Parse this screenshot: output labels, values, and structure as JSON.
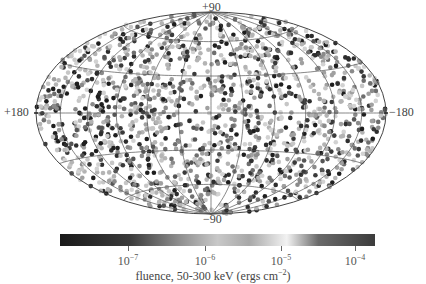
{
  "chart_data": {
    "type": "scatter",
    "projection": "aitoff/hammer all-sky (ellipse)",
    "title": "",
    "coordinate_labels": {
      "top": "+90",
      "bottom": "-90",
      "left": "+180",
      "right": "-180"
    },
    "grid": {
      "on": true,
      "meridians_deg": [
        -150,
        -120,
        -90,
        -60,
        -30,
        0,
        30,
        60,
        90,
        120,
        150
      ],
      "parallels_deg": [
        -60,
        -30,
        0,
        30,
        60
      ]
    },
    "points": {
      "description": "Isotropically distributed gamma-ray bursts across the sky, grayscale-coded by fluence",
      "approx_count": 1600,
      "distribution": "uniform over sphere"
    },
    "colorbar": {
      "label": "fluence, 50-300 keV (ergs cm^-2)",
      "scale": "log",
      "range": [
        1.5e-08,
        0.0003
      ],
      "ticks": [
        1e-07,
        1e-06,
        1e-05,
        0.0001
      ],
      "tick_labels": [
        "10^-7",
        "10^-6",
        "10^-5",
        "10^-4"
      ],
      "colormap_stops": [
        {
          "pos": 0.0,
          "color": "#1a1a1a"
        },
        {
          "pos": 0.22,
          "color": "#3a3a3a"
        },
        {
          "pos": 0.38,
          "color": "#8f8f8f"
        },
        {
          "pos": 0.5,
          "color": "#c8c8c8"
        },
        {
          "pos": 0.6,
          "color": "#a8a8a8"
        },
        {
          "pos": 0.72,
          "color": "#f2f2f2"
        },
        {
          "pos": 0.82,
          "color": "#6a6a6a"
        },
        {
          "pos": 1.0,
          "color": "#3c3c3c"
        }
      ]
    },
    "legend_position": "bottom"
  },
  "labels": {
    "top": "+90",
    "bottom": "−90",
    "left": "+180",
    "right": "−180"
  },
  "colorbar": {
    "ticks": [
      {
        "base": "10",
        "exp": "−7",
        "x": 128
      },
      {
        "base": "10",
        "exp": "−6",
        "x": 205
      },
      {
        "base": "10",
        "exp": "−5",
        "x": 281
      },
      {
        "base": "10",
        "exp": "−4",
        "x": 355
      }
    ],
    "title_main": "fluence, 50-300 keV (ergs cm",
    "title_exp": "−2",
    "title_close": ")"
  }
}
